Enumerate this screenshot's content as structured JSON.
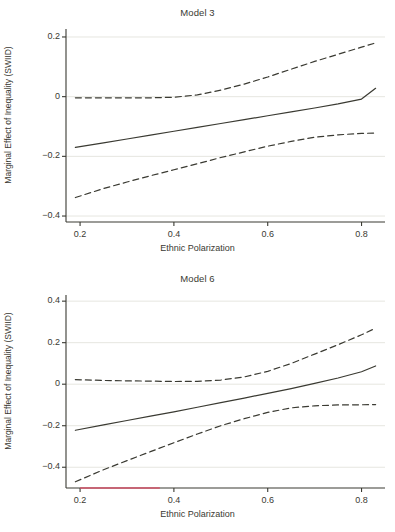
{
  "figure": {
    "background": "#ffffff",
    "line_color": "#3a3a32",
    "grid_color": "#e6e6e0",
    "accent_color": "#d4556a"
  },
  "panels": [
    {
      "id": "model3",
      "title": "Model 3",
      "xlabel": "Ethnic Polarization",
      "ylabel": "Marginal Effect of Inequality (SWIID)"
    },
    {
      "id": "model6",
      "title": "Model 6",
      "xlabel": "Ethnic Polarization",
      "ylabel": "Marginal Effect of Inequality (SWIID)"
    }
  ],
  "chart_data": [
    {
      "type": "line",
      "title": "Model 3",
      "xlabel": "Ethnic Polarization",
      "ylabel": "Marginal Effect of Inequality (SWIID)",
      "xlim": [
        0.17,
        0.85
      ],
      "ylim": [
        -0.42,
        0.22
      ],
      "xticks": [
        0.2,
        0.4,
        0.6,
        0.8
      ],
      "xtick_labels": [
        "0.2",
        "0.4",
        "0.6",
        "0.8"
      ],
      "yticks": [
        0.2,
        0,
        -0.2,
        -0.4
      ],
      "ytick_labels": [
        "0.2",
        "0",
        "-0.2",
        "-0.4"
      ],
      "grid": "horizontal",
      "legend": "none",
      "x": [
        0.19,
        0.25,
        0.3,
        0.35,
        0.4,
        0.45,
        0.5,
        0.55,
        0.6,
        0.65,
        0.7,
        0.75,
        0.8,
        0.83
      ],
      "series": [
        {
          "name": "Marginal effect (point estimate)",
          "style": "solid",
          "values": [
            -0.17,
            -0.155,
            -0.142,
            -0.129,
            -0.116,
            -0.103,
            -0.09,
            -0.077,
            -0.064,
            -0.051,
            -0.038,
            -0.024,
            -0.008,
            0.028
          ]
        },
        {
          "name": "Upper 95% confidence bound",
          "style": "dashed",
          "values": [
            -0.004,
            -0.004,
            -0.004,
            -0.004,
            -0.002,
            0.006,
            0.022,
            0.042,
            0.066,
            0.092,
            0.118,
            0.142,
            0.166,
            0.18
          ]
        },
        {
          "name": "Lower 95% confidence bound",
          "style": "dashed",
          "values": [
            -0.338,
            -0.308,
            -0.286,
            -0.265,
            -0.245,
            -0.225,
            -0.204,
            -0.185,
            -0.166,
            -0.15,
            -0.136,
            -0.128,
            -0.123,
            -0.122
          ]
        }
      ]
    },
    {
      "type": "line",
      "title": "Model 6",
      "xlabel": "Ethnic Polarization",
      "ylabel": "Marginal Effect of Inequality (SWIID)",
      "xlim": [
        0.17,
        0.85
      ],
      "ylim": [
        -0.5,
        0.42
      ],
      "xticks": [
        0.2,
        0.4,
        0.6,
        0.8
      ],
      "xtick_labels": [
        "0.2",
        "0.4",
        "0.6",
        "0.8"
      ],
      "yticks": [
        0.4,
        0.2,
        0,
        -0.2,
        -0.4
      ],
      "ytick_labels": [
        "0.4",
        "0.2",
        "0",
        "-0.2",
        "-0.4"
      ],
      "grid": "horizontal",
      "legend": "none",
      "x": [
        0.19,
        0.25,
        0.3,
        0.35,
        0.4,
        0.45,
        0.5,
        0.55,
        0.6,
        0.65,
        0.7,
        0.75,
        0.8,
        0.83
      ],
      "series": [
        {
          "name": "Marginal effect (point estimate)",
          "style": "solid",
          "values": [
            -0.222,
            -0.196,
            -0.175,
            -0.154,
            -0.133,
            -0.111,
            -0.089,
            -0.067,
            -0.044,
            -0.021,
            0.004,
            0.03,
            0.06,
            0.088
          ]
        },
        {
          "name": "Upper 95% confidence bound",
          "style": "dashed",
          "values": [
            0.022,
            0.018,
            0.016,
            0.015,
            0.013,
            0.014,
            0.02,
            0.035,
            0.062,
            0.1,
            0.145,
            0.19,
            0.238,
            0.27
          ]
        },
        {
          "name": "Lower 95% confidence bound",
          "style": "dashed",
          "values": [
            -0.47,
            -0.412,
            -0.368,
            -0.325,
            -0.282,
            -0.24,
            -0.2,
            -0.166,
            -0.136,
            -0.114,
            -0.104,
            -0.1,
            -0.099,
            -0.098
          ]
        }
      ],
      "baseline_marker": {
        "name": "red-baseline-segment",
        "color": "#d4556a",
        "y": -0.5,
        "x_start": 0.2,
        "x_end": 0.37
      }
    }
  ]
}
